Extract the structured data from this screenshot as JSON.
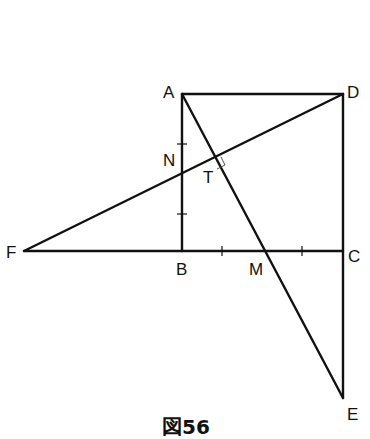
{
  "figure": {
    "caption": "図56",
    "points": {
      "A": {
        "label": "A",
        "x": 182,
        "y": 94
      },
      "D": {
        "label": "D",
        "x": 343,
        "y": 94
      },
      "B": {
        "label": "B",
        "x": 182,
        "y": 251
      },
      "C": {
        "label": "C",
        "x": 343,
        "y": 251
      },
      "F": {
        "label": "F",
        "x": 24,
        "y": 251
      },
      "M": {
        "label": "M",
        "x": 262,
        "y": 251
      },
      "E": {
        "label": "E",
        "x": 343,
        "y": 398
      },
      "N": {
        "label": "N",
        "x": 182,
        "y": 172
      },
      "T": {
        "label": "T",
        "x": 215,
        "y": 160
      }
    },
    "segments": [
      "AD",
      "AB",
      "DC",
      "CE",
      "FC",
      "FD",
      "AE"
    ],
    "tick_marks": [
      "AN",
      "NB",
      "BM_1",
      "BM_2",
      "MC_1",
      "MC_2"
    ],
    "right_angle_at": "T",
    "stroke_color": "#111111"
  }
}
